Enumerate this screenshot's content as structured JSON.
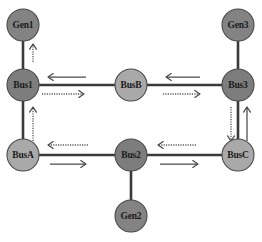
{
  "diagram": {
    "canvas": {
      "width": 262,
      "height": 242,
      "background": "#ffffff"
    },
    "colors": {
      "generator_fill": "#838383",
      "bus_dark_fill": "#7d7d7d",
      "bus_light_fill": "#a9a9a9",
      "node_stroke": "#4a4a4a",
      "branch_stroke": "#3a3a3a",
      "flow_solid": "#4a4a4a",
      "flow_dotted": "#5a5a5a",
      "label_text": "#1a1a1a"
    },
    "nodes": [
      {
        "id": "gen1",
        "label": "Gen1",
        "kind": "generator",
        "cx": 23,
        "cy": 25,
        "r": 16,
        "fill": "#838383"
      },
      {
        "id": "gen3",
        "label": "Gen3",
        "kind": "generator",
        "cx": 238,
        "cy": 25,
        "r": 16,
        "fill": "#838383"
      },
      {
        "id": "gen2",
        "label": "Gen2",
        "kind": "generator",
        "cx": 131,
        "cy": 216,
        "r": 16,
        "fill": "#838383"
      },
      {
        "id": "bus1",
        "label": "Bus1",
        "kind": "bus",
        "cx": 23,
        "cy": 85,
        "r": 16,
        "fill": "#7d7d7d"
      },
      {
        "id": "busb",
        "label": "BusB",
        "kind": "bus",
        "cx": 131,
        "cy": 85,
        "r": 16,
        "fill": "#a9a9a9"
      },
      {
        "id": "bus3",
        "label": "Bus3",
        "kind": "bus",
        "cx": 238,
        "cy": 85,
        "r": 16,
        "fill": "#7d7d7d"
      },
      {
        "id": "busa",
        "label": "BusA",
        "kind": "bus",
        "cx": 23,
        "cy": 155,
        "r": 16,
        "fill": "#a9a9a9"
      },
      {
        "id": "bus2",
        "label": "Bus2",
        "kind": "bus",
        "cx": 131,
        "cy": 155,
        "r": 16,
        "fill": "#7d7d7d"
      },
      {
        "id": "busc",
        "label": "BusC",
        "kind": "bus",
        "cx": 238,
        "cy": 155,
        "r": 16,
        "fill": "#a9a9a9"
      }
    ],
    "branches": [
      {
        "id": "gen1-bus1",
        "from": "gen1",
        "to": "bus1",
        "orientation": "vertical",
        "x1": 23,
        "y1": 25,
        "x2": 23,
        "y2": 85
      },
      {
        "id": "gen3-bus3",
        "from": "gen3",
        "to": "bus3",
        "orientation": "vertical",
        "x1": 238,
        "y1": 25,
        "x2": 238,
        "y2": 85
      },
      {
        "id": "bus2-gen2",
        "from": "bus2",
        "to": "gen2",
        "orientation": "vertical",
        "x1": 131,
        "y1": 155,
        "x2": 131,
        "y2": 216
      },
      {
        "id": "bus1-busa",
        "from": "bus1",
        "to": "busa",
        "orientation": "vertical",
        "x1": 23,
        "y1": 85,
        "x2": 23,
        "y2": 155
      },
      {
        "id": "bus3-busc",
        "from": "bus3",
        "to": "busc",
        "orientation": "vertical",
        "x1": 238,
        "y1": 85,
        "x2": 238,
        "y2": 155
      },
      {
        "id": "bus1-busb",
        "from": "bus1",
        "to": "busb",
        "orientation": "horizontal",
        "x1": 23,
        "y1": 85,
        "x2": 131,
        "y2": 85
      },
      {
        "id": "busb-bus3",
        "from": "busb",
        "to": "bus3",
        "orientation": "horizontal",
        "x1": 131,
        "y1": 85,
        "x2": 238,
        "y2": 85
      },
      {
        "id": "busa-bus2",
        "from": "busa",
        "to": "bus2",
        "orientation": "horizontal",
        "x1": 23,
        "y1": 155,
        "x2": 131,
        "y2": 155
      },
      {
        "id": "bus2-busc",
        "from": "bus2",
        "to": "busc",
        "orientation": "horizontal",
        "x1": 131,
        "y1": 155,
        "x2": 238,
        "y2": 155
      }
    ],
    "flow_arrows": [
      {
        "id": "flow-gen1-bus1-up",
        "branch": "gen1-bus1",
        "style": "dotted",
        "direction": "up",
        "x1": 33,
        "y1": 62,
        "x2": 33,
        "y2": 44
      },
      {
        "id": "flow-bus1-busa-up",
        "branch": "bus1-busa",
        "style": "dotted",
        "direction": "up",
        "x1": 33,
        "y1": 141,
        "x2": 33,
        "y2": 107
      },
      {
        "id": "flow-bus3-busc-down",
        "branch": "bus3-busc",
        "style": "dotted",
        "direction": "down",
        "x1": 231,
        "y1": 107,
        "x2": 231,
        "y2": 141
      },
      {
        "id": "flow-busc-bus3-up",
        "branch": "bus3-busc",
        "style": "solid",
        "direction": "up",
        "x1": 247,
        "y1": 141,
        "x2": 247,
        "y2": 107
      },
      {
        "id": "flow-busb-bus1-left",
        "branch": "bus1-busb",
        "style": "solid",
        "direction": "left",
        "x1": 86,
        "y1": 77,
        "x2": 48,
        "y2": 77
      },
      {
        "id": "flow-bus1-busb-right",
        "branch": "bus1-busb",
        "style": "dotted",
        "direction": "right",
        "x1": 42,
        "y1": 94,
        "x2": 84,
        "y2": 94
      },
      {
        "id": "flow-bus3-busb-left",
        "branch": "busb-bus3",
        "style": "solid",
        "direction": "left",
        "x1": 200,
        "y1": 77,
        "x2": 166,
        "y2": 77
      },
      {
        "id": "flow-busb-bus3-right",
        "branch": "busb-bus3",
        "style": "dotted",
        "direction": "right",
        "x1": 163,
        "y1": 94,
        "x2": 200,
        "y2": 94
      },
      {
        "id": "flow-bus2-busa-left",
        "branch": "busa-bus2",
        "style": "dotted",
        "direction": "left",
        "x1": 88,
        "y1": 145,
        "x2": 48,
        "y2": 145
      },
      {
        "id": "flow-busa-bus2-right",
        "branch": "busa-bus2",
        "style": "solid",
        "direction": "right",
        "x1": 50,
        "y1": 164,
        "x2": 86,
        "y2": 164
      },
      {
        "id": "flow-busc-bus2-left",
        "branch": "bus2-busc",
        "style": "dotted",
        "direction": "left",
        "x1": 196,
        "y1": 145,
        "x2": 158,
        "y2": 145
      },
      {
        "id": "flow-bus2-busc-right",
        "branch": "bus2-busc",
        "style": "solid",
        "direction": "right",
        "x1": 160,
        "y1": 164,
        "x2": 198,
        "y2": 164
      }
    ]
  }
}
